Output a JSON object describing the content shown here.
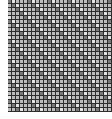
{
  "grid": {
    "columns": 26,
    "rows": 28,
    "cell_size_px": 4,
    "colors": {
      "border": "#2e2e2e",
      "cell_default": "#bdbdbd",
      "cell_dark": "#7a7a7a",
      "cell_light": "#e4e4e4",
      "background": "#ffffff"
    }
  }
}
